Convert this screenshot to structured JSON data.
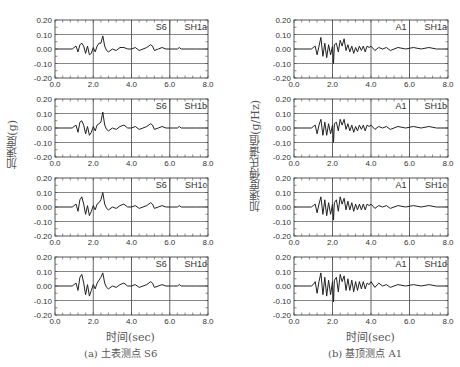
{
  "figure": {
    "left_panel": {
      "caption": "(a) 土表测点 S6",
      "ylabel": "加速度(g)",
      "xlabel": "时间(sec)"
    },
    "right_panel": {
      "caption": "(b) 基顶测点 A1",
      "ylabel": "加速度傅氏谱值(g/Hz)",
      "xlabel": "时间(sec)"
    }
  },
  "chart_data": [
    {
      "type": "line",
      "panel": "left",
      "station": "S6",
      "case": "SH1a",
      "xlabel": "时间(sec)",
      "ylabel": "加速度(g)",
      "xlim": [
        0,
        8
      ],
      "ylim": [
        -0.2,
        0.2
      ],
      "xticks": [
        "0.0",
        "2.0",
        "4.0",
        "6.0",
        "8.0"
      ],
      "yticks": [
        "0.20",
        "0.10",
        "0.00",
        "-0.10",
        "-0.20"
      ],
      "grid": true,
      "x": [
        0,
        0.9,
        1.0,
        1.1,
        1.2,
        1.3,
        1.4,
        1.5,
        1.6,
        1.7,
        1.8,
        1.9,
        2.0,
        2.1,
        2.2,
        2.3,
        2.4,
        2.5,
        2.6,
        2.7,
        2.8,
        3.0,
        3.2,
        3.4,
        3.6,
        3.8,
        4.0,
        4.2,
        4.4,
        4.6,
        4.8,
        5.0,
        5.1,
        5.2,
        5.4,
        5.6,
        5.8,
        6.0,
        6.4,
        6.5,
        6.6,
        6.8,
        7.0,
        7.4,
        8.0
      ],
      "y": [
        0,
        0,
        0.01,
        0.02,
        -0.02,
        0.03,
        0.04,
        0.02,
        -0.03,
        0.02,
        -0.04,
        -0.03,
        0.01,
        -0.02,
        0.02,
        0.04,
        0.04,
        0.09,
        0.02,
        -0.01,
        -0.02,
        0.0,
        -0.01,
        0.01,
        0.01,
        0.0,
        0.0,
        0.01,
        -0.01,
        0.0,
        0.01,
        0.03,
        0.02,
        -0.01,
        0.0,
        0.01,
        0.0,
        0.0,
        0.0,
        0.01,
        0.0,
        0.0,
        0.0,
        0.0,
        0.0
      ]
    },
    {
      "type": "line",
      "panel": "left",
      "station": "S6",
      "case": "SH1b",
      "xlim": [
        0,
        8
      ],
      "ylim": [
        -0.2,
        0.2
      ],
      "grid": true,
      "x": [
        0,
        0.9,
        1.0,
        1.1,
        1.2,
        1.3,
        1.4,
        1.5,
        1.6,
        1.7,
        1.8,
        1.9,
        2.0,
        2.1,
        2.2,
        2.3,
        2.4,
        2.5,
        2.6,
        2.7,
        2.8,
        3.0,
        3.2,
        3.4,
        3.6,
        3.8,
        4.0,
        4.2,
        4.4,
        4.6,
        4.8,
        5.0,
        5.1,
        5.2,
        5.4,
        5.6,
        5.8,
        6.0,
        6.4,
        6.5,
        6.6,
        6.8,
        7.0,
        7.4,
        8.0
      ],
      "y": [
        0,
        0,
        0.01,
        0.02,
        -0.03,
        0.04,
        0.05,
        0.02,
        -0.04,
        0.01,
        -0.05,
        -0.03,
        0.01,
        -0.02,
        0.02,
        0.03,
        0.04,
        0.11,
        0.02,
        -0.01,
        -0.02,
        0.0,
        -0.01,
        0.01,
        0.02,
        0.0,
        0.0,
        0.01,
        -0.01,
        0.0,
        0.01,
        0.03,
        0.02,
        -0.01,
        0.0,
        0.01,
        0.0,
        0.0,
        0.0,
        0.01,
        0.0,
        0.0,
        0.0,
        0.0,
        0.0
      ]
    },
    {
      "type": "line",
      "panel": "left",
      "station": "S6",
      "case": "SH1c",
      "xlim": [
        0,
        8
      ],
      "ylim": [
        -0.2,
        0.2
      ],
      "grid": true,
      "x": [
        0,
        0.9,
        1.0,
        1.1,
        1.2,
        1.3,
        1.4,
        1.5,
        1.6,
        1.7,
        1.8,
        1.9,
        2.0,
        2.1,
        2.2,
        2.3,
        2.4,
        2.5,
        2.6,
        2.7,
        2.8,
        3.0,
        3.2,
        3.4,
        3.6,
        3.8,
        4.0,
        4.2,
        4.4,
        4.6,
        4.8,
        5.0,
        5.1,
        5.2,
        5.4,
        5.6,
        5.8,
        6.0,
        6.4,
        6.5,
        6.6,
        6.8,
        7.0,
        7.4,
        8.0
      ],
      "y": [
        0,
        0,
        0.01,
        0.02,
        -0.03,
        0.05,
        0.07,
        0.02,
        -0.05,
        0.01,
        -0.06,
        -0.03,
        0.01,
        -0.02,
        0.02,
        0.03,
        0.05,
        0.1,
        0.02,
        -0.01,
        -0.02,
        0.0,
        -0.01,
        0.01,
        0.02,
        0.0,
        0.0,
        0.01,
        -0.01,
        0.0,
        0.01,
        0.03,
        0.02,
        -0.01,
        0.0,
        0.01,
        0.0,
        0.0,
        0.0,
        0.01,
        0.0,
        0.0,
        0.0,
        0.0,
        0.0
      ]
    },
    {
      "type": "line",
      "panel": "left",
      "station": "S6",
      "case": "SH1d",
      "xlim": [
        0,
        8
      ],
      "ylim": [
        -0.2,
        0.2
      ],
      "grid": true,
      "x": [
        0,
        0.9,
        1.0,
        1.1,
        1.2,
        1.3,
        1.4,
        1.5,
        1.6,
        1.7,
        1.8,
        1.9,
        2.0,
        2.1,
        2.2,
        2.3,
        2.4,
        2.5,
        2.6,
        2.7,
        2.8,
        3.0,
        3.2,
        3.4,
        3.6,
        3.8,
        4.0,
        4.2,
        4.4,
        4.6,
        4.8,
        5.0,
        5.1,
        5.2,
        5.4,
        5.6,
        5.8,
        6.0,
        6.4,
        6.5,
        6.6,
        6.8,
        7.0,
        7.4,
        8.0
      ],
      "y": [
        0,
        0,
        0.01,
        0.02,
        -0.03,
        0.06,
        0.08,
        0.02,
        -0.06,
        0.01,
        -0.07,
        -0.03,
        0.01,
        -0.02,
        0.02,
        0.04,
        0.06,
        0.09,
        0.02,
        -0.01,
        -0.02,
        0.0,
        -0.01,
        0.01,
        0.02,
        0.0,
        0.0,
        0.01,
        -0.01,
        0.0,
        0.01,
        0.03,
        0.02,
        -0.01,
        0.0,
        0.01,
        0.0,
        0.0,
        0.0,
        0.01,
        0.0,
        0.0,
        0.0,
        0.0,
        0.0
      ]
    },
    {
      "type": "line",
      "panel": "right",
      "station": "A1",
      "case": "SH1a",
      "xlabel": "时间(sec)",
      "ylabel": "加速度傅氏谱值(g/Hz)",
      "xlim": [
        0,
        8
      ],
      "ylim": [
        -0.2,
        0.2
      ],
      "xticks": [
        "0.0",
        "2.0",
        "4.0",
        "6.0",
        "8.0"
      ],
      "yticks": [
        "0.20",
        "0.10",
        "0.00",
        "-0.10",
        "-0.20"
      ],
      "grid": true,
      "x": [
        0,
        0.9,
        1.0,
        1.1,
        1.2,
        1.3,
        1.4,
        1.5,
        1.6,
        1.7,
        1.8,
        1.9,
        2.0,
        2.05,
        2.1,
        2.2,
        2.3,
        2.4,
        2.5,
        2.6,
        2.7,
        2.8,
        2.9,
        3.0,
        3.1,
        3.2,
        3.3,
        3.4,
        3.5,
        3.6,
        3.7,
        3.8,
        3.9,
        4.0,
        4.2,
        4.4,
        4.6,
        4.8,
        5.0,
        5.4,
        5.8,
        6.2,
        6.6,
        7.0,
        7.4,
        8.0
      ],
      "y": [
        0,
        0,
        0.01,
        0.02,
        -0.04,
        0.02,
        0.08,
        -0.05,
        0.04,
        -0.06,
        0.03,
        -0.04,
        0.02,
        -0.1,
        0.03,
        0.04,
        -0.02,
        0.06,
        0.02,
        0.07,
        -0.01,
        0.03,
        -0.02,
        0.02,
        -0.03,
        0.01,
        -0.02,
        0.02,
        -0.01,
        0.02,
        -0.02,
        0.02,
        0.01,
        0.02,
        -0.01,
        0.01,
        0.0,
        0.01,
        -0.01,
        0.01,
        0.0,
        0.01,
        0.0,
        0.01,
        0.0,
        0.0
      ]
    },
    {
      "type": "line",
      "panel": "right",
      "station": "A1",
      "case": "SH1b",
      "xlim": [
        0,
        8
      ],
      "ylim": [
        -0.2,
        0.2
      ],
      "grid": true,
      "x": [
        0,
        0.9,
        1.0,
        1.1,
        1.2,
        1.3,
        1.4,
        1.5,
        1.6,
        1.7,
        1.8,
        1.9,
        2.0,
        2.05,
        2.1,
        2.2,
        2.3,
        2.4,
        2.5,
        2.6,
        2.7,
        2.8,
        2.9,
        3.0,
        3.1,
        3.2,
        3.3,
        3.4,
        3.5,
        3.6,
        3.7,
        3.8,
        3.9,
        4.0,
        4.2,
        4.4,
        4.6,
        4.8,
        5.0,
        5.4,
        5.8,
        6.2,
        6.6,
        7.0,
        7.4,
        8.0
      ],
      "y": [
        0,
        0,
        0.01,
        0.02,
        -0.04,
        0.02,
        0.06,
        -0.05,
        0.04,
        -0.05,
        0.03,
        -0.04,
        0.02,
        -0.1,
        0.03,
        0.04,
        -0.02,
        0.06,
        0.02,
        0.06,
        -0.01,
        0.03,
        -0.02,
        0.02,
        -0.03,
        0.01,
        -0.02,
        0.02,
        -0.01,
        0.02,
        -0.02,
        0.02,
        0.01,
        0.02,
        -0.01,
        0.01,
        0.0,
        0.01,
        -0.01,
        0.01,
        0.0,
        0.01,
        0.0,
        0.01,
        0.0,
        0.0
      ]
    },
    {
      "type": "line",
      "panel": "right",
      "station": "A1",
      "case": "SH1c",
      "xlim": [
        0,
        8
      ],
      "ylim": [
        -0.2,
        0.2
      ],
      "grid": true,
      "x": [
        0,
        0.9,
        1.0,
        1.1,
        1.2,
        1.3,
        1.4,
        1.5,
        1.6,
        1.7,
        1.8,
        1.9,
        2.0,
        2.05,
        2.1,
        2.2,
        2.3,
        2.4,
        2.5,
        2.6,
        2.7,
        2.8,
        2.9,
        3.0,
        3.1,
        3.2,
        3.3,
        3.4,
        3.5,
        3.6,
        3.7,
        3.8,
        3.9,
        4.0,
        4.2,
        4.4,
        4.6,
        4.8,
        5.0,
        5.4,
        5.8,
        6.2,
        6.6,
        7.0,
        7.4,
        8.0
      ],
      "y": [
        0,
        0,
        0.01,
        0.02,
        -0.04,
        0.02,
        0.07,
        -0.05,
        0.05,
        -0.06,
        0.03,
        -0.05,
        0.02,
        -0.09,
        0.03,
        0.05,
        -0.03,
        0.07,
        0.02,
        0.06,
        -0.02,
        0.04,
        -0.02,
        0.03,
        -0.03,
        0.02,
        -0.02,
        0.02,
        -0.02,
        0.02,
        -0.02,
        0.02,
        0.01,
        0.02,
        -0.01,
        0.01,
        0.0,
        0.01,
        -0.01,
        0.01,
        0.0,
        0.01,
        0.0,
        0.01,
        0.0,
        0.0
      ]
    },
    {
      "type": "line",
      "panel": "right",
      "station": "A1",
      "case": "SH1d",
      "xlim": [
        0,
        8
      ],
      "ylim": [
        -0.2,
        0.2
      ],
      "grid": true,
      "x": [
        0,
        0.9,
        1.0,
        1.1,
        1.2,
        1.3,
        1.4,
        1.5,
        1.6,
        1.7,
        1.8,
        1.9,
        2.0,
        2.05,
        2.1,
        2.2,
        2.3,
        2.4,
        2.5,
        2.6,
        2.7,
        2.8,
        2.9,
        3.0,
        3.1,
        3.2,
        3.3,
        3.4,
        3.5,
        3.6,
        3.7,
        3.8,
        3.9,
        4.0,
        4.2,
        4.4,
        4.6,
        4.8,
        5.0,
        5.4,
        5.8,
        6.2,
        6.6,
        7.0,
        7.4,
        8.0
      ],
      "y": [
        0,
        0,
        0.01,
        0.03,
        -0.05,
        0.03,
        0.09,
        -0.06,
        0.06,
        -0.07,
        0.04,
        -0.06,
        0.03,
        -0.11,
        0.04,
        0.06,
        -0.04,
        0.08,
        0.03,
        0.07,
        -0.03,
        0.05,
        -0.03,
        0.04,
        -0.04,
        0.03,
        -0.03,
        0.03,
        -0.02,
        0.03,
        -0.02,
        0.02,
        0.01,
        0.03,
        -0.01,
        0.02,
        0.0,
        0.01,
        -0.01,
        0.01,
        0.0,
        0.01,
        0.0,
        0.01,
        0.0,
        0.0
      ]
    }
  ],
  "layout": {
    "left_x0": 55,
    "left_x1": 208,
    "right_x0": 294,
    "right_x1": 448,
    "row_tops": [
      20,
      99,
      178,
      257
    ],
    "plot_height": 58,
    "line_color": "#222222",
    "grid_color": "#555555",
    "frame_color": "#444444",
    "text_color": "#333333"
  }
}
